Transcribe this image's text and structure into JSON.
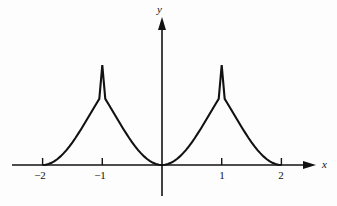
{
  "figure": {
    "background_color": "#fdfdfd",
    "ink_color": "#121212"
  },
  "axes": {
    "x_label": "x",
    "y_label": "y",
    "x_arrow": "arrow-right",
    "y_arrow": "arrow-up"
  },
  "ticks": {
    "x": [
      {
        "label": "−2",
        "value": -2,
        "px": 40
      },
      {
        "label": "−1",
        "value": -1,
        "px": 100
      },
      {
        "label": "1",
        "value": 1,
        "px": 222
      },
      {
        "label": "2",
        "value": 2,
        "px": 281
      }
    ]
  },
  "chart_data": {
    "type": "line",
    "title": "",
    "xlabel": "x",
    "ylabel": "y",
    "xlim": [
      -2.35,
      2.35
    ],
    "ylim": [
      -0.35,
      1.35
    ],
    "grid": false,
    "legend": null,
    "series": [
      {
        "name": "|sin(pi x / 2)| — style cusped wave",
        "description": "Curve is zero and tangent to the x-axis at x = -2, 0, 2; rises to sharp cusp peaks of height 1 at x = -1 and x = 1; drawn only on -2 <= x <= 2.",
        "x": [
          -2.0,
          -1.95,
          -1.9,
          -1.85,
          -1.8,
          -1.75,
          -1.7,
          -1.65,
          -1.6,
          -1.55,
          -1.5,
          -1.45,
          -1.4,
          -1.35,
          -1.3,
          -1.25,
          -1.2,
          -1.15,
          -1.1,
          -1.05,
          -1.0,
          -0.95,
          -0.9,
          -0.85,
          -0.8,
          -0.75,
          -0.7,
          -0.65,
          -0.6,
          -0.55,
          -0.5,
          -0.45,
          -0.4,
          -0.35,
          -0.3,
          -0.25,
          -0.2,
          -0.15,
          -0.1,
          -0.05,
          0.0,
          0.05,
          0.1,
          0.15,
          0.2,
          0.25,
          0.3,
          0.35,
          0.4,
          0.45,
          0.5,
          0.55,
          0.6,
          0.65,
          0.7,
          0.75,
          0.8,
          0.85,
          0.9,
          0.95,
          1.0,
          1.05,
          1.1,
          1.15,
          1.2,
          1.25,
          1.3,
          1.35,
          1.4,
          1.45,
          1.5,
          1.55,
          1.6,
          1.65,
          1.7,
          1.75,
          1.8,
          1.85,
          1.9,
          1.95,
          2.0
        ],
        "y": [
          0.0,
          0.002,
          0.01,
          0.022,
          0.039,
          0.06,
          0.086,
          0.116,
          0.149,
          0.187,
          0.227,
          0.27,
          0.316,
          0.363,
          0.412,
          0.462,
          0.512,
          0.563,
          0.613,
          0.662,
          1.0,
          0.662,
          0.613,
          0.563,
          0.512,
          0.462,
          0.412,
          0.363,
          0.316,
          0.27,
          0.227,
          0.187,
          0.149,
          0.116,
          0.086,
          0.06,
          0.039,
          0.022,
          0.01,
          0.002,
          0.0,
          0.002,
          0.01,
          0.022,
          0.039,
          0.06,
          0.086,
          0.116,
          0.149,
          0.187,
          0.227,
          0.27,
          0.316,
          0.363,
          0.412,
          0.462,
          0.512,
          0.563,
          0.613,
          0.662,
          1.0,
          0.662,
          0.613,
          0.563,
          0.512,
          0.462,
          0.412,
          0.363,
          0.316,
          0.27,
          0.227,
          0.187,
          0.149,
          0.116,
          0.086,
          0.06,
          0.039,
          0.022,
          0.01,
          0.002,
          0.0
        ],
        "peaks": [
          {
            "x": -1,
            "y": 1
          },
          {
            "x": 1,
            "y": 1
          }
        ],
        "zeros": [
          -2,
          0,
          2
        ],
        "color": "#121212",
        "line_width": 2.1
      }
    ]
  }
}
